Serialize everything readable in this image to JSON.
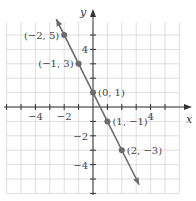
{
  "chart_data": {
    "type": "line",
    "title": "",
    "xlabel": "x",
    "ylabel": "y",
    "xlim": [
      -6,
      6
    ],
    "ylim": [
      -6,
      6
    ],
    "grid": true,
    "x_ticks": [
      -4,
      -2,
      4
    ],
    "x_tick_labels": [
      "−4",
      "−2",
      "4"
    ],
    "y_ticks": [
      4,
      -2,
      -4
    ],
    "y_tick_labels": [
      "4",
      "−2",
      "−4"
    ],
    "series": [
      {
        "name": "y = -2x + 1",
        "x": [
          -2,
          -1,
          0,
          1,
          2
        ],
        "y": [
          5,
          3,
          1,
          -1,
          -3
        ],
        "color": "#6b6b6b",
        "arrows": "both"
      }
    ],
    "points": [
      {
        "x": -2,
        "y": 5,
        "label": "(−2, 5)",
        "label_side": "left"
      },
      {
        "x": -1,
        "y": 3,
        "label": "(−1, 3)",
        "label_side": "left"
      },
      {
        "x": 0,
        "y": 1,
        "label": "(0, 1)",
        "label_side": "right"
      },
      {
        "x": 1,
        "y": -1,
        "label": "(1, −1)",
        "label_side": "right"
      },
      {
        "x": 2,
        "y": -3,
        "label": "(2, −3)",
        "label_side": "right"
      }
    ],
    "colors": {
      "grid": "#d6d6d6",
      "axis": "#333333",
      "line": "#6b6b6b",
      "point": "#6b6b6b"
    }
  }
}
